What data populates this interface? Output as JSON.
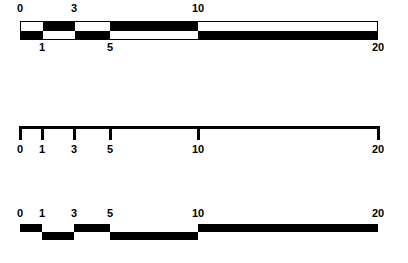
{
  "figure": {
    "ink_color": "#000000",
    "background_color": "#ffffff"
  },
  "scale": {
    "breakpoints": [
      0,
      1,
      3,
      5,
      10,
      20
    ],
    "pixel_positions": [
      20,
      42,
      74,
      110,
      198,
      378
    ],
    "min": 0,
    "max": 20
  },
  "chart_data": {
    "type": "bar",
    "title": "",
    "xlabel": "",
    "ylabel": "",
    "xlim": [
      0,
      20
    ],
    "grid": false,
    "legend": false,
    "categories": [
      "0-1",
      "1-3",
      "3-5",
      "5-10",
      "10-20"
    ],
    "x": [
      0,
      1,
      3,
      5,
      10,
      20
    ],
    "series": [
      {
        "name": "band-top-row",
        "values": [
          "white",
          "black",
          "white",
          "black",
          "white"
        ]
      },
      {
        "name": "band-bottom-row",
        "values": [
          "black",
          "white",
          "black",
          "white",
          "black"
        ]
      },
      {
        "name": "staircase-level",
        "values": [
          "up",
          "down",
          "up",
          "down",
          "up"
        ]
      }
    ]
  },
  "panel_band": {
    "name": "alternating-band",
    "segments_top": [
      {
        "from": 0,
        "to": 1,
        "fill": "white"
      },
      {
        "from": 1,
        "to": 3,
        "fill": "black"
      },
      {
        "from": 3,
        "to": 5,
        "fill": "white"
      },
      {
        "from": 5,
        "to": 10,
        "fill": "black"
      },
      {
        "from": 10,
        "to": 20,
        "fill": "white"
      }
    ],
    "segments_bottom": [
      {
        "from": 0,
        "to": 1,
        "fill": "black"
      },
      {
        "from": 1,
        "to": 3,
        "fill": "white"
      },
      {
        "from": 3,
        "to": 5,
        "fill": "black"
      },
      {
        "from": 5,
        "to": 10,
        "fill": "white"
      },
      {
        "from": 10,
        "to": 20,
        "fill": "black"
      }
    ],
    "labels_above": [
      {
        "text": "0",
        "value": 0
      },
      {
        "text": "3",
        "value": 3
      },
      {
        "text": "10",
        "value": 10
      }
    ],
    "labels_below": [
      {
        "text": "1",
        "value": 1
      },
      {
        "text": "5",
        "value": 5
      },
      {
        "text": "20",
        "value": 20
      }
    ]
  },
  "panel_axis": {
    "name": "tick-axis",
    "ticks": [
      {
        "text": "0",
        "value": 0
      },
      {
        "text": "1",
        "value": 1
      },
      {
        "text": "3",
        "value": 3
      },
      {
        "text": "5",
        "value": 5
      },
      {
        "text": "10",
        "value": 10
      },
      {
        "text": "20",
        "value": 20
      }
    ]
  },
  "panel_stair": {
    "name": "staircase-bars",
    "labels": [
      {
        "text": "0",
        "value": 0
      },
      {
        "text": "1",
        "value": 1
      },
      {
        "text": "3",
        "value": 3
      },
      {
        "text": "5",
        "value": 5
      },
      {
        "text": "10",
        "value": 10
      },
      {
        "text": "20",
        "value": 20
      }
    ],
    "bars": [
      {
        "from": 0,
        "to": 1,
        "level": "up"
      },
      {
        "from": 1,
        "to": 3,
        "level": "down"
      },
      {
        "from": 3,
        "to": 5,
        "level": "up"
      },
      {
        "from": 5,
        "to": 10,
        "level": "down"
      },
      {
        "from": 10,
        "to": 20,
        "level": "up"
      }
    ]
  }
}
